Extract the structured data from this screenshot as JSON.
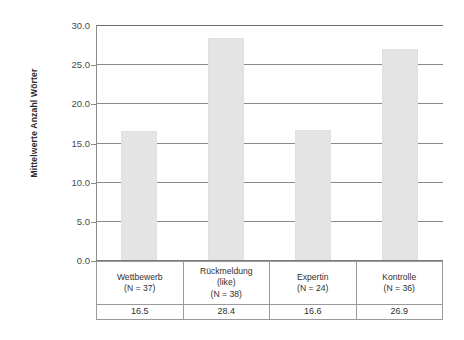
{
  "chart_data": {
    "type": "bar",
    "title": "",
    "xlabel": "",
    "ylabel": "Mittelwerte Anzahl Wörter",
    "ylim": [
      0,
      30
    ],
    "ytick_labels": [
      "0.0",
      "5.0",
      "10.0",
      "15.0",
      "20.0",
      "25.0",
      "30.0"
    ],
    "ytick_values": [
      0,
      5,
      10,
      15,
      20,
      25,
      30
    ],
    "grid": true,
    "legend": "none",
    "bar_color": "#e4e4e4",
    "categories": [
      "Wettbewerb (N = 37)",
      "Rückmeldung (like) (N = 38)",
      "Expertin (N = 24)",
      "Kontrolle (N = 36)"
    ],
    "values": [
      16.5,
      28.4,
      16.6,
      26.9
    ]
  },
  "axis": {
    "y_title": "Mittelwerte Anzahl Wörter"
  },
  "table": {
    "columns": [
      {
        "lines": [
          "Wettbewerb",
          "(N = 37)"
        ],
        "value": "16.5"
      },
      {
        "lines": [
          "Rückmeldung",
          "(like)",
          "(N = 38)"
        ],
        "value": "28.4"
      },
      {
        "lines": [
          "Expertin",
          "(N = 24)"
        ],
        "value": "16.6"
      },
      {
        "lines": [
          "Kontrolle",
          "(N = 36)"
        ],
        "value": "26.9"
      }
    ]
  }
}
